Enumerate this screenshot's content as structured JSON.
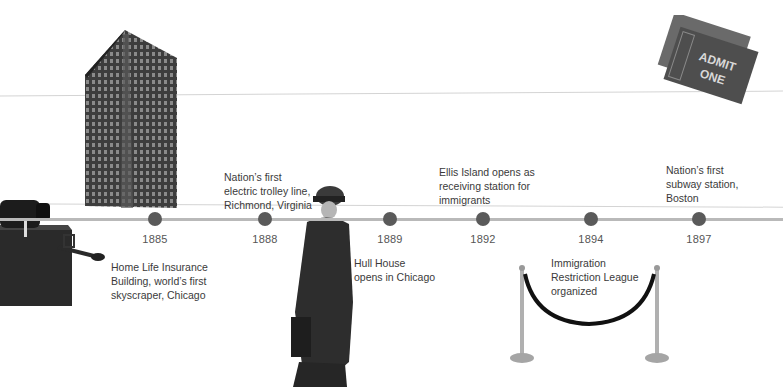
{
  "timeline": {
    "line_color": "#b9b9b9",
    "dot_color": "#5a5a5a",
    "events": [
      {
        "year": "1885",
        "x": 155,
        "label_lines": [
          "Home Life Insurance",
          "Building, world’s first",
          "skyscraper, Chicago"
        ]
      },
      {
        "year": "1888",
        "x": 265,
        "label_lines": [
          "Nation’s first",
          "electric trolley line,",
          "Richmond, Virginia"
        ]
      },
      {
        "year": "1889",
        "x": 390,
        "label_lines": [
          "Hull House",
          "opens in Chicago"
        ]
      },
      {
        "year": "1892",
        "x": 483,
        "label_lines": [
          "Ellis Island opens as",
          "receiving station for",
          "immigrants"
        ]
      },
      {
        "year": "1894",
        "x": 591,
        "label_lines": [
          "Immigration",
          "Restriction League",
          "organized"
        ]
      },
      {
        "year": "1897",
        "x": 699,
        "label_lines": [
          "Nation’s first",
          "subway station,",
          "Boston"
        ]
      }
    ]
  },
  "images": {
    "skyscraper": "Home Life Insurance Building photo",
    "phonograph": "Phonograph / projector photo",
    "woman": "Jane Addams portrait photo",
    "ticket": {
      "description": "Admit one ticket",
      "text_line1": "ADMIT",
      "text_line2": "ONE"
    },
    "stanchions": "Velvet rope barrier photo"
  }
}
